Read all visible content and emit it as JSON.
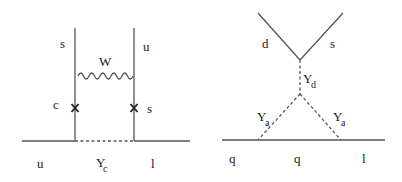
{
  "diagrams": {
    "left": {
      "labels": {
        "top_left_quark": "s",
        "top_right_quark": "u",
        "boson": "W",
        "mid_left_quark": "c",
        "mid_right_quark": "s",
        "bottom_left": "u",
        "exchange_main": "Y",
        "exchange_sub": "c",
        "bottom_right": "l"
      },
      "vertex_marks": [
        "x-mark",
        "x-mark"
      ]
    },
    "right": {
      "labels": {
        "top_left_quark": "d",
        "top_right_quark": "s",
        "vertical_main": "Y",
        "vertical_sub": "d",
        "left_diag_main": "Y",
        "left_diag_sub": "a",
        "right_diag_main": "Y",
        "right_diag_sub": "a",
        "bottom_left": "q",
        "bottom_middle": "q",
        "bottom_right": "l"
      }
    }
  },
  "colors": {
    "line": "#555555",
    "text": "#1a1a1a",
    "background": "#ffffff"
  }
}
